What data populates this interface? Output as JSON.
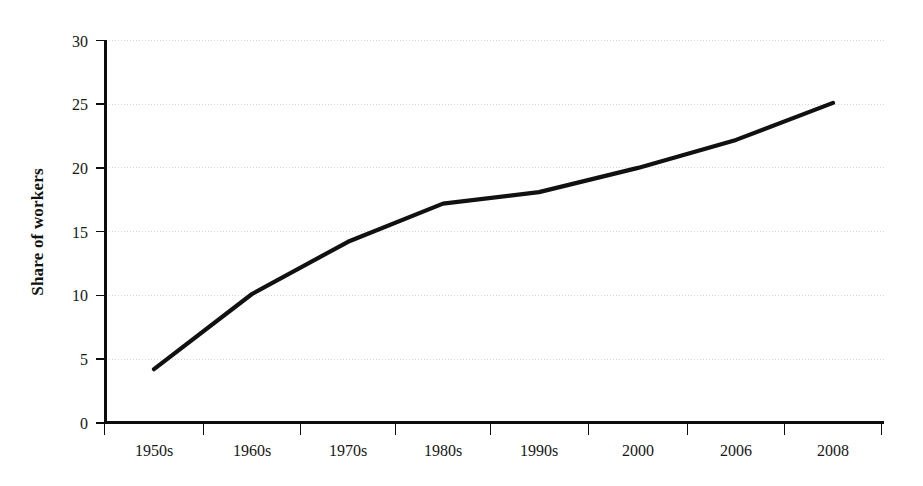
{
  "chart_data": {
    "type": "line",
    "title": "",
    "subtitle": "",
    "xlabel": "",
    "ylabel": "Share of workers",
    "categories": [
      "1950s",
      "1960s",
      "1970s",
      "1980s",
      "1990s",
      "2000",
      "2006",
      "2008"
    ],
    "values": [
      4.2,
      10.1,
      14.2,
      17.2,
      18.1,
      20.0,
      22.2,
      25.1
    ],
    "series": [
      {
        "name": "Share of workers",
        "values": [
          4.2,
          10.1,
          14.2,
          17.2,
          18.1,
          20.0,
          22.2,
          25.1
        ]
      }
    ],
    "ylim": [
      0,
      30
    ],
    "yticks": [
      0,
      5,
      10,
      15,
      20,
      25,
      30
    ],
    "ytick_labels": [
      "0",
      "5",
      "10",
      "15",
      "20",
      "25",
      "30"
    ],
    "xtick_labels": [
      "1950s",
      "1960s",
      "1970s",
      "1980s",
      "1990s",
      "2000",
      "2006",
      "2008"
    ],
    "grid": true,
    "grid_axis": "y",
    "legend": "none",
    "line_color": "#111111",
    "grid_color": "#d6d6d6",
    "axis_color": "#0d0d0d",
    "background_color": "#ffffff",
    "annotations": []
  }
}
